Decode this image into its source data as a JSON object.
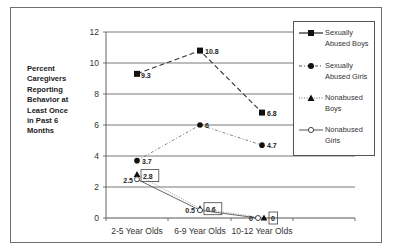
{
  "chart_data": {
    "type": "line",
    "title": "",
    "xlabel": "",
    "ylabel": "Percent Caregivers Reporting Behavior at Least Once in Past 6 Months",
    "categories": [
      "2-5 Year Olds",
      "6-9 Year Olds",
      "10-12 Year Olds"
    ],
    "ylim": [
      0,
      12
    ],
    "yticks": [
      0,
      2,
      4,
      6,
      8,
      10,
      12
    ],
    "grid": true,
    "legend_position": "right",
    "series": [
      {
        "name": "Sexually Abused Boys",
        "values": [
          9.3,
          10.8,
          6.8
        ],
        "labels": [
          "9.3",
          "10.8",
          "6.8"
        ],
        "marker": "square",
        "line": "dashed"
      },
      {
        "name": "Sexually Abused Girls",
        "values": [
          3.7,
          6,
          4.7
        ],
        "labels": [
          "3.7",
          "6",
          "4.7"
        ],
        "marker": "circle",
        "line": "dash-dot"
      },
      {
        "name": "Nonabused Boys",
        "values": [
          2.8,
          0.6,
          0
        ],
        "labels": [
          "2.8",
          "0.6",
          "0"
        ],
        "marker": "triangle",
        "line": "dotted"
      },
      {
        "name": "Nonabused Girls",
        "values": [
          2.5,
          0.5,
          0
        ],
        "labels": [
          "2.5",
          "0.5",
          "0"
        ],
        "marker": "open-circle",
        "line": "solid"
      }
    ]
  },
  "ylabel_text": "Percent Caregivers Reporting Behavior at Least Once in Past 6 Months",
  "legend": {
    "items": [
      {
        "line1": "Sexually",
        "line2": "Abused Boys"
      },
      {
        "line1": "Sexually",
        "line2": "Abused Girls"
      },
      {
        "line1": "Nonabused",
        "line2": "Boys"
      },
      {
        "line1": "Nonabused",
        "line2": "Girls"
      }
    ]
  }
}
